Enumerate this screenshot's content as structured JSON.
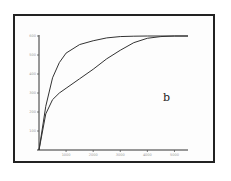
{
  "chart_data": {
    "type": "line",
    "title": "",
    "xlabel": "",
    "ylabel": "",
    "panel_label": "b",
    "xlim": [
      0,
      5500
    ],
    "ylim": [
      0,
      600
    ],
    "xticks": [
      1000,
      2000,
      3000,
      4000,
      5000
    ],
    "xtick_labels": [
      "1000",
      "2000",
      "3000",
      "4000",
      "5000"
    ],
    "yticks": [
      100,
      200,
      300,
      400,
      500,
      600
    ],
    "ytick_labels": [
      "100",
      "200",
      "300",
      "400",
      "500",
      "600"
    ],
    "grid": false,
    "series": [
      {
        "name": "upper curve",
        "x": [
          0,
          250,
          500,
          750,
          1000,
          1500,
          2000,
          2500,
          3000,
          3500,
          4000,
          4500,
          5000,
          5500
        ],
        "y": [
          0,
          230,
          380,
          460,
          510,
          555,
          575,
          590,
          597,
          599,
          600,
          600,
          600,
          600
        ]
      },
      {
        "name": "lower curve",
        "x": [
          0,
          250,
          500,
          750,
          1000,
          1500,
          2000,
          2500,
          3000,
          3500,
          4000,
          4500,
          5000,
          5500
        ],
        "y": [
          0,
          190,
          265,
          300,
          325,
          375,
          425,
          480,
          525,
          565,
          588,
          597,
          600,
          600
        ]
      }
    ]
  }
}
